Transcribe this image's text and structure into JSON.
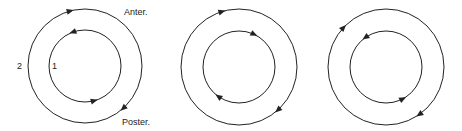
{
  "diagrams": [
    {
      "id": "pair-1",
      "center": [
        85,
        66
      ],
      "outer": {
        "r": 57,
        "direction": "clockwise",
        "arrows_deg": [
          -105,
          48
        ]
      },
      "inner": {
        "r": 36,
        "direction": "counterclockwise",
        "arrows_deg": [
          -110,
          75
        ]
      },
      "labels": {
        "outer_number": "2",
        "inner_number": "1",
        "top_right": "Anter.",
        "bottom_right": "Poster."
      }
    },
    {
      "id": "pair-2",
      "center": [
        239,
        67
      ],
      "outer": {
        "r": 58,
        "direction": "clockwise",
        "arrows_deg": [
          -107,
          48
        ]
      },
      "inner": {
        "r": 36,
        "direction": "clockwise",
        "arrows_deg": [
          -65,
          125
        ]
      },
      "labels": {}
    },
    {
      "id": "pair-3",
      "center": [
        386,
        67
      ],
      "outer": {
        "r": 58,
        "direction": "clockwise",
        "arrows_deg": [
          -137,
          55
        ]
      },
      "inner": {
        "r": 36,
        "direction": "counterclockwise",
        "arrows_deg": [
          -125,
          62
        ]
      },
      "labels": {}
    }
  ],
  "colors": {
    "stroke": "#222222",
    "background": "#ffffff"
  }
}
